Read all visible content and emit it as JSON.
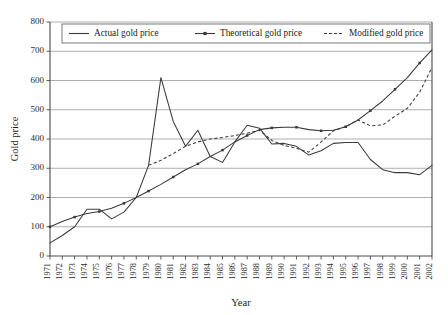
{
  "chart_data": {
    "type": "line",
    "title": "",
    "xlabel": "Year",
    "ylabel": "Gold price",
    "grid": true,
    "legend_position": "top-center",
    "xlim": [
      1971,
      2002
    ],
    "ylim": [
      0,
      800
    ],
    "ytick_step": 100,
    "yticks": [
      0,
      100,
      200,
      300,
      400,
      500,
      600,
      700,
      800
    ],
    "categories": [
      "1971",
      "1972",
      "1973",
      "1974",
      "1975",
      "1976",
      "1977",
      "1978",
      "1979",
      "1980",
      "1981",
      "1982",
      "1983",
      "1984",
      "1985",
      "1986",
      "1987",
      "1988",
      "1989",
      "1990",
      "1991",
      "1992",
      "1993",
      "1994",
      "1995",
      "1996",
      "1997",
      "1998",
      "1999",
      "2000",
      "2001",
      "2002"
    ],
    "series": [
      {
        "name": "Actual gold price",
        "style": "solid",
        "marker": "none",
        "color": "#3a3a3a",
        "values": [
          45,
          70,
          100,
          160,
          160,
          127,
          150,
          200,
          310,
          610,
          460,
          375,
          430,
          340,
          320,
          390,
          447,
          437,
          383,
          385,
          375,
          345,
          360,
          385,
          388,
          388,
          330,
          295,
          285,
          285,
          278,
          310
        ]
      },
      {
        "name": "Theoretical gold price",
        "style": "solid",
        "marker": "cross",
        "color": "#3a3a3a",
        "values": [
          100,
          118,
          133,
          145,
          152,
          163,
          180,
          200,
          222,
          245,
          270,
          295,
          315,
          340,
          362,
          390,
          412,
          432,
          438,
          440,
          440,
          432,
          428,
          430,
          442,
          465,
          497,
          530,
          570,
          610,
          660,
          705
        ]
      },
      {
        "name": "Modified gold price",
        "style": "dashed",
        "marker": "none",
        "color": "#3a3a3a",
        "start_year": "1979",
        "values": [
          null,
          null,
          null,
          null,
          null,
          null,
          null,
          null,
          310,
          327,
          350,
          375,
          390,
          400,
          405,
          412,
          420,
          430,
          395,
          378,
          368,
          355,
          390,
          428,
          442,
          465,
          445,
          448,
          478,
          505,
          560,
          645
        ]
      }
    ]
  },
  "legend": {
    "items": [
      {
        "label": "Actual gold price",
        "style": "solid"
      },
      {
        "label": "Theoretical gold price",
        "style": "solid-marker"
      },
      {
        "label": "Modified gold price",
        "style": "dashed"
      }
    ]
  },
  "axes": {
    "y_title": "Gold price",
    "x_title": "Year"
  }
}
